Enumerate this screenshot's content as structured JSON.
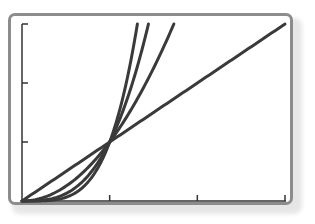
{
  "chart_data": {
    "type": "line",
    "title": "",
    "xlabel": "",
    "ylabel": "",
    "xlim": [
      0,
      3
    ],
    "ylim": [
      0,
      3
    ],
    "x_ticks": [
      0,
      1,
      2,
      3
    ],
    "y_ticks": [
      0,
      1,
      2,
      3
    ],
    "tick_labels_shown": false,
    "grid": false,
    "legend": null,
    "series": [
      {
        "name": "y = x",
        "expr": "x",
        "x": [
          0,
          1,
          3
        ],
        "values": [
          0,
          1,
          3
        ]
      },
      {
        "name": "y = x^2",
        "expr": "x^2",
        "x": [
          0,
          0.5,
          1,
          1.5,
          1.732
        ],
        "values": [
          0,
          0.25,
          1,
          2.25,
          3
        ]
      },
      {
        "name": "y = x^3",
        "expr": "x^3",
        "x": [
          0,
          0.5,
          1,
          1.25,
          1.442
        ],
        "values": [
          0,
          0.125,
          1,
          1.953,
          3
        ]
      },
      {
        "name": "y = x^4",
        "expr": "x^4",
        "x": [
          0,
          0.5,
          1,
          1.2,
          1.316
        ],
        "values": [
          0,
          0.0625,
          1,
          2.074,
          3
        ]
      }
    ],
    "intersection_points": [
      [
        0,
        0
      ],
      [
        1,
        1
      ]
    ],
    "line_color": "#3a3a3a"
  },
  "colors": {
    "frame": "#8c8c8c",
    "curve": "#3a3a3a",
    "axis": "#333333",
    "background": "#ffffff"
  }
}
